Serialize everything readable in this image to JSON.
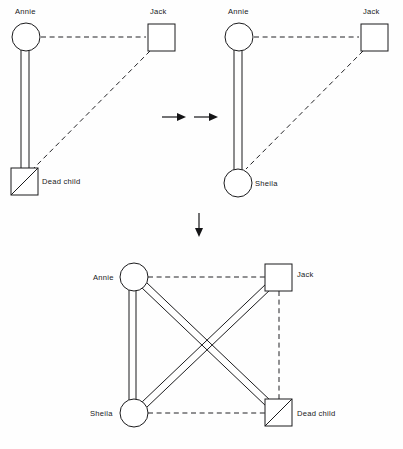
{
  "figure": {
    "background_color": "#fefefe",
    "line_color": "#1b1b1d",
    "text_color": "#18181a",
    "panel_count": 3,
    "transition_symbols": [
      "arrow-right",
      "arrow-right",
      "arrow-down"
    ]
  },
  "legend": {
    "circle_meaning": "female",
    "square_meaning": "male",
    "diagonal_slash_meaning": "deceased",
    "double_solid_line_meaning": "strong / enmeshed bond",
    "dashed_line_meaning": "distant or broken bond"
  },
  "panels": [
    {
      "id": "panel-1",
      "name": "initial-configuration",
      "nodes": [
        {
          "id": "annie",
          "label": "Annie",
          "shape": "circle",
          "deceased": false,
          "label_position": "above"
        },
        {
          "id": "jack",
          "label": "Jack",
          "shape": "square",
          "deceased": false,
          "label_position": "above"
        },
        {
          "id": "dead_child",
          "label": "Dead child",
          "shape": "square",
          "deceased": true,
          "label_position": "right"
        }
      ],
      "links": [
        {
          "from": "annie",
          "to": "jack",
          "style": "dashed"
        },
        {
          "from": "annie",
          "to": "dead_child",
          "style": "double-solid"
        },
        {
          "from": "jack",
          "to": "dead_child",
          "style": "dashed"
        }
      ]
    },
    {
      "id": "panel-2",
      "name": "replacement-configuration",
      "nodes": [
        {
          "id": "annie",
          "label": "Annie",
          "shape": "circle",
          "deceased": false,
          "label_position": "above"
        },
        {
          "id": "jack",
          "label": "Jack",
          "shape": "square",
          "deceased": false,
          "label_position": "above"
        },
        {
          "id": "sheila",
          "label": "Sheila",
          "shape": "circle",
          "deceased": false,
          "label_position": "right"
        }
      ],
      "links": [
        {
          "from": "annie",
          "to": "jack",
          "style": "dashed"
        },
        {
          "from": "annie",
          "to": "sheila",
          "style": "double-solid"
        },
        {
          "from": "jack",
          "to": "sheila",
          "style": "dashed"
        }
      ]
    },
    {
      "id": "panel-3",
      "name": "combined-configuration",
      "nodes": [
        {
          "id": "annie",
          "label": "Annie",
          "shape": "circle",
          "deceased": false,
          "label_position": "left"
        },
        {
          "id": "jack",
          "label": "Jack",
          "shape": "square",
          "deceased": false,
          "label_position": "right"
        },
        {
          "id": "sheila",
          "label": "Sheila",
          "shape": "circle",
          "deceased": false,
          "label_position": "left"
        },
        {
          "id": "dead_child",
          "label": "Dead child",
          "shape": "square",
          "deceased": true,
          "label_position": "right"
        }
      ],
      "links": [
        {
          "from": "annie",
          "to": "jack",
          "style": "dashed"
        },
        {
          "from": "annie",
          "to": "sheila",
          "style": "double-solid"
        },
        {
          "from": "annie",
          "to": "dead_child",
          "style": "double-solid"
        },
        {
          "from": "sheila",
          "to": "jack",
          "style": "double-solid"
        },
        {
          "from": "sheila",
          "to": "dead_child",
          "style": "dashed"
        },
        {
          "from": "jack",
          "to": "dead_child",
          "style": "dashed"
        }
      ]
    }
  ],
  "labels": {
    "annie": "Annie",
    "jack": "Jack",
    "sheila": "Sheila",
    "dead_child": "Dead child"
  }
}
